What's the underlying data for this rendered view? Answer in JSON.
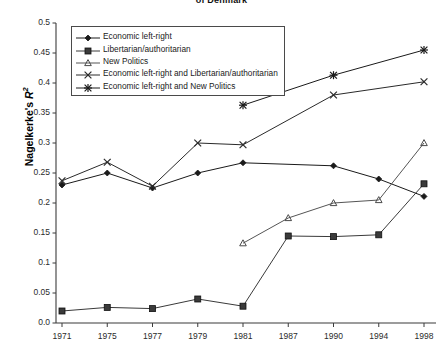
{
  "chart_data": {
    "type": "line",
    "title": "of Denmark",
    "xlabel": "",
    "ylabel": "Nagelkerke's R²",
    "ylim": [
      0,
      0.5
    ],
    "grid": false,
    "legend_position": "top-left-inside",
    "categories": [
      "1971",
      "1975",
      "1977",
      "1979",
      "1981",
      "1987",
      "1990",
      "1994",
      "1998"
    ],
    "ytick_labels": [
      "0.0",
      "0.05",
      "0.1",
      "0.15",
      "0.2",
      "0.25",
      "0.3",
      "0.35",
      "0.4",
      "0.45",
      "0.5"
    ],
    "ytick_values": [
      0,
      0.05,
      0.1,
      0.15,
      0.2,
      0.25,
      0.3,
      0.35,
      0.4,
      0.45,
      0.5
    ],
    "series": [
      {
        "name": "Economic left-right",
        "marker": "diamond",
        "color": "#1a1a1a",
        "values": [
          0.23,
          0.25,
          0.225,
          0.25,
          0.267,
          null,
          0.262,
          0.24,
          0.211
        ]
      },
      {
        "name": "Libertarian/authoritarian",
        "marker": "square",
        "color": "#3a3a3a",
        "values": [
          0.02,
          0.026,
          0.024,
          0.04,
          0.028,
          0.145,
          0.144,
          0.147,
          0.232
        ]
      },
      {
        "name": "New Politics",
        "marker": "triangle",
        "color": "#555555",
        "values": [
          null,
          null,
          null,
          null,
          0.133,
          0.175,
          0.2,
          0.205,
          0.3
        ]
      },
      {
        "name": "Economic left-right and Libertarian/authoritarian",
        "marker": "cross",
        "color": "#2a2a2a",
        "values": [
          0.237,
          0.268,
          0.228,
          0.3,
          0.297,
          null,
          0.38,
          null,
          0.402
        ]
      },
      {
        "name": "Economic left-right  and New Politics",
        "marker": "asterisk",
        "color": "#1a1a1a",
        "values": [
          null,
          null,
          null,
          null,
          0.363,
          null,
          0.413,
          null,
          0.455
        ]
      }
    ]
  },
  "legend": {
    "items": [
      "Economic left-right",
      "Libertarian/authoritarian",
      "New Politics",
      "Economic left-right and Libertarian/authoritarian",
      "Economic left-right  and New Politics"
    ]
  }
}
